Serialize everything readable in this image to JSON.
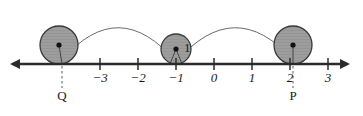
{
  "figure": {
    "kind": "rolling-circle-number-line-diagram",
    "colors": {
      "circle_fill": "#9d9d9d",
      "circle_stroke": "#3a3a3a",
      "axis": "#2b2b2b",
      "arc": "#6b6b6b",
      "dashed_drop": "#8a8a8a",
      "center_dot": "#111111",
      "text": "#1a1a1a",
      "background": "#ffffff"
    },
    "axis": {
      "name": "number-line",
      "y": 64,
      "x_start": 10,
      "x_end": 350,
      "left_arrow": true,
      "right_arrow": true,
      "tick_spacing": 38,
      "origin_x": 214,
      "ticks": [
        {
          "label": "−3",
          "value": -3,
          "x": 100
        },
        {
          "label": "−2",
          "value": -2,
          "x": 138
        },
        {
          "label": "−1",
          "value": -1,
          "x": 176
        },
        {
          "label": "0",
          "value": 0,
          "x": 214
        },
        {
          "label": "1",
          "value": 1,
          "x": 252
        },
        {
          "label": "2",
          "value": 2,
          "x": 290
        },
        {
          "label": "3",
          "value": 3,
          "x": 328
        }
      ],
      "tick_label_y": 82,
      "tick_half_height": 6
    },
    "circles": [
      {
        "name": "circle-left",
        "cx": 59,
        "cy": 45,
        "r": 19,
        "tangent_x": 62,
        "has_center_dot": true,
        "has_spoke": true
      },
      {
        "name": "circle-middle",
        "cx": 176,
        "cy": 49,
        "r": 15,
        "tangent_x": 176,
        "has_center_dot": true,
        "has_spoke": true,
        "label": "1",
        "label_x": 184,
        "label_y": 52
      },
      {
        "name": "circle-right",
        "cx": 293,
        "cy": 45,
        "r": 19,
        "tangent_x": 293,
        "has_center_dot": true,
        "has_spoke": true
      }
    ],
    "arcs": [
      {
        "name": "arc-left-to-middle",
        "start_x": 62,
        "start_y": 60,
        "end_x": 176,
        "end_y": 62,
        "peak_y": 8
      },
      {
        "name": "arc-middle-to-right",
        "start_x": 176,
        "start_y": 62,
        "end_x": 293,
        "end_y": 60,
        "peak_y": 8
      }
    ],
    "drop_lines": [
      {
        "name": "drop-line-q",
        "x": 62,
        "y_top": 66,
        "y_bottom": 88,
        "label": "Q",
        "label_y": 100
      },
      {
        "name": "drop-line-p",
        "x": 293,
        "y_top": 66,
        "y_bottom": 88,
        "label": "P",
        "label_y": 100
      }
    ]
  }
}
